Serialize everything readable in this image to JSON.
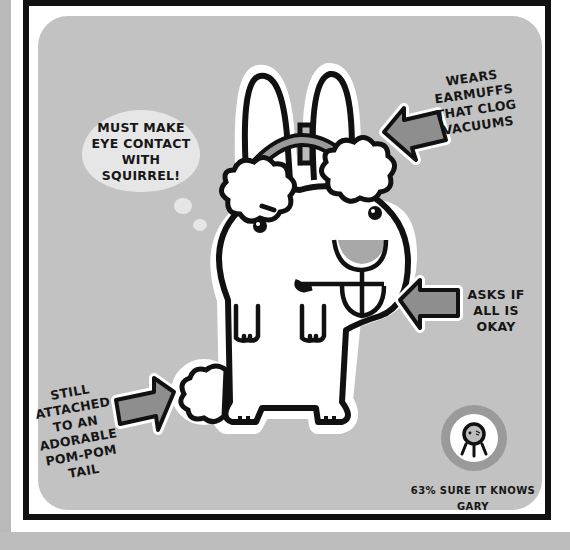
{
  "illustration": {
    "subject": "bunny-with-earmuffs",
    "annotations": {
      "thought_bubble": "MUST MAKE\nEYE CONTACT\nWITH\nSQUIRREL!",
      "earmuffs": "WEARS\nEARMUFFS\nTHAT CLOG\nVACUUMS",
      "asks": "ASKS IF\nALL IS\nOKAY",
      "tail": "STILL\nATTACHED\nTO AN\nADORABLE\nPOM-POM\nTAIL"
    },
    "badge": {
      "icon": "jellyfish-icon",
      "caption": "63% SURE IT KNOWS GARY"
    }
  },
  "colors": {
    "panel": "#c2c2c2",
    "ink": "#111111",
    "arrow_fill": "#8e8e8e",
    "bubble": "#e6e6e6",
    "badge_ring": "#9a9a9a"
  }
}
